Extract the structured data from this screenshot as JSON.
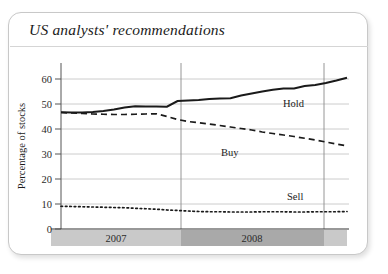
{
  "card": {
    "title": "US analysts' recommendations"
  },
  "chart_data": {
    "type": "line",
    "title": "US analysts' recommendations",
    "xlabel": "",
    "ylabel": "Percentage of stocks",
    "ylim": [
      0,
      65
    ],
    "yticks": [
      0,
      10,
      20,
      30,
      40,
      50,
      60
    ],
    "ytick_labels": [
      "0",
      "10",
      "20",
      "30",
      "40",
      "50",
      "60"
    ],
    "grid": "horizontal-and-vertical",
    "legend_position": "inline-right-of-series",
    "x_band_labels": [
      "2007",
      "2008"
    ],
    "x_band_colors": [
      "#c9c9c9",
      "#a9a9a9"
    ],
    "x": [
      0,
      1,
      2,
      3,
      4,
      5,
      6,
      7,
      8,
      9,
      10,
      11,
      12,
      13,
      14,
      15,
      16,
      17,
      18,
      19,
      20,
      21,
      22,
      23,
      24,
      25,
      26,
      27
    ],
    "series": [
      {
        "name": "Hold",
        "style": "solid",
        "color": "#1a1a1a",
        "values": [
          46.7,
          46.6,
          46.6,
          46.8,
          47.2,
          47.8,
          48.6,
          49.1,
          49.0,
          49.0,
          48.9,
          51.2,
          51.4,
          51.6,
          52.0,
          52.2,
          52.3,
          53.4,
          54.2,
          55.0,
          55.7,
          56.2,
          56.2,
          57.2,
          57.6,
          58.4,
          59.4,
          60.5
        ],
        "label_value": "Hold"
      },
      {
        "name": "Buy",
        "style": "dashed",
        "color": "#1a1a1a",
        "values": [
          46.6,
          46.4,
          46.2,
          46.0,
          45.9,
          45.8,
          45.8,
          45.9,
          46.0,
          46.1,
          45.0,
          43.8,
          43.0,
          42.5,
          42.0,
          41.4,
          40.8,
          40.2,
          39.6,
          38.8,
          38.2,
          37.6,
          37.0,
          36.3,
          35.6,
          34.8,
          34.0,
          33.2
        ],
        "label_value": "Buy"
      },
      {
        "name": "Sell",
        "style": "dotted",
        "color": "#1a1a1a",
        "values": [
          9.1,
          9.0,
          8.9,
          8.8,
          8.7,
          8.6,
          8.5,
          8.3,
          8.1,
          7.9,
          7.6,
          7.4,
          7.2,
          7.0,
          6.9,
          6.9,
          6.8,
          6.8,
          6.8,
          6.9,
          6.9,
          6.9,
          6.8,
          6.8,
          6.9,
          6.9,
          6.9,
          7.0
        ],
        "label_value": "Sell"
      }
    ],
    "series_labels": [
      {
        "name": "Hold",
        "text": "Hold"
      },
      {
        "name": "Buy",
        "text": "Buy"
      },
      {
        "name": "Sell",
        "text": "Sell"
      }
    ]
  }
}
